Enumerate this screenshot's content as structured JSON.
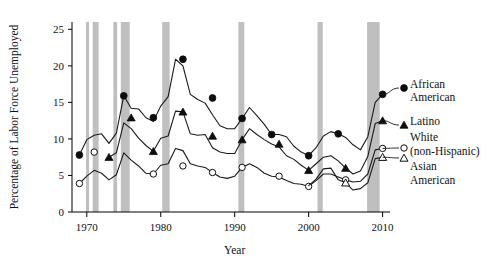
{
  "chart_data": {
    "type": "line",
    "title": "",
    "xlabel": "Year",
    "ylabel": "Percentage of Labor Force Unemployed",
    "xlim": [
      1968,
      2011
    ],
    "ylim": [
      0,
      26
    ],
    "xticks": [
      1970,
      1980,
      1990,
      2000,
      2010
    ],
    "xticklabels": [
      "1970",
      "1980",
      "1990",
      "2000",
      "2010"
    ],
    "yticks": [
      0,
      5,
      10,
      15,
      20,
      25
    ],
    "yticklabels": [
      "0",
      "5",
      "10",
      "15",
      "20",
      "25"
    ],
    "grid": false,
    "legend_position": "right-outside",
    "recession_bands": [
      {
        "start": 1969.9,
        "end": 1970.3
      },
      {
        "start": 1970.8,
        "end": 1971.6
      },
      {
        "start": 1973.6,
        "end": 1974.1
      },
      {
        "start": 1974.6,
        "end": 1975.8
      },
      {
        "start": 1980.2,
        "end": 1981.2
      },
      {
        "start": 1990.5,
        "end": 1991.3
      },
      {
        "start": 2001.2,
        "end": 2001.9
      },
      {
        "start": 2007.9,
        "end": 2009.6
      }
    ],
    "series": [
      {
        "name": "African American",
        "label_lines": [
          "African",
          "American"
        ],
        "marker": "filled-circle",
        "x": [
          1969,
          1970,
          1971,
          1972,
          1973,
          1974,
          1975,
          1976,
          1977,
          1978,
          1979,
          1980,
          1981,
          1982,
          1983,
          1984,
          1985,
          1986,
          1987,
          1988,
          1989,
          1990,
          1991,
          1992,
          1993,
          1994,
          1995,
          1996,
          1997,
          1998,
          1999,
          2000,
          2001,
          2002,
          2003,
          2004,
          2005,
          2006,
          2007,
          2008,
          2009,
          2010
        ],
        "y": [
          7.8,
          9.9,
          10.5,
          10.7,
          9.4,
          10.8,
          15.9,
          14.2,
          14.1,
          12.9,
          12.4,
          14.5,
          15.8,
          20.9,
          20.0,
          16.1,
          15.4,
          14.9,
          13.3,
          11.8,
          11.4,
          11.4,
          12.8,
          14.3,
          13.2,
          12.0,
          10.6,
          10.6,
          10.3,
          9.0,
          8.2,
          7.7,
          8.8,
          10.4,
          11.0,
          10.7,
          10.2,
          9.2,
          8.5,
          10.3,
          15.0,
          16.1
        ],
        "annotated_points": [
          {
            "x": 1969,
            "y": 7.8
          },
          {
            "x": 1975,
            "y": 15.9
          },
          {
            "x": 1979,
            "y": 12.9
          },
          {
            "x": 1983,
            "y": 20.9
          },
          {
            "x": 1987,
            "y": 15.6
          },
          {
            "x": 1991,
            "y": 12.8
          },
          {
            "x": 1995,
            "y": 10.6
          },
          {
            "x": 2000,
            "y": 7.7
          },
          {
            "x": 2004,
            "y": 10.7
          },
          {
            "x": 2010,
            "y": 16.1
          }
        ]
      },
      {
        "name": "Latino",
        "label_lines": [
          "Latino"
        ],
        "marker": "filled-triangle",
        "x": [
          1973,
          1974,
          1975,
          1976,
          1977,
          1978,
          1979,
          1980,
          1981,
          1982,
          1983,
          1984,
          1985,
          1986,
          1987,
          1988,
          1989,
          1990,
          1991,
          1992,
          1993,
          1994,
          1995,
          1996,
          1997,
          1998,
          1999,
          2000,
          2001,
          2002,
          2003,
          2004,
          2005,
          2006,
          2007,
          2008,
          2009,
          2010
        ],
        "y": [
          7.5,
          8.1,
          12.2,
          11.4,
          10.1,
          9.1,
          8.3,
          10.1,
          10.4,
          13.8,
          13.7,
          10.7,
          10.5,
          10.6,
          8.8,
          8.2,
          8.0,
          8.0,
          9.9,
          11.4,
          10.6,
          9.9,
          9.3,
          8.9,
          7.7,
          7.2,
          6.4,
          5.7,
          6.6,
          7.5,
          7.7,
          7.0,
          6.0,
          5.2,
          5.6,
          7.6,
          12.1,
          12.5
        ],
        "annotated_points": [
          {
            "x": 1973,
            "y": 7.5
          },
          {
            "x": 1976,
            "y": 12.9
          },
          {
            "x": 1979,
            "y": 8.3
          },
          {
            "x": 1983,
            "y": 13.7
          },
          {
            "x": 1987,
            "y": 10.4
          },
          {
            "x": 1991,
            "y": 9.9
          },
          {
            "x": 1996,
            "y": 9.3
          },
          {
            "x": 2000,
            "y": 5.7
          },
          {
            "x": 2005,
            "y": 6.0
          },
          {
            "x": 2010,
            "y": 12.5
          }
        ]
      },
      {
        "name": "White (non-Hispanic)",
        "label_lines": [
          "White",
          "(non-Hispanic)"
        ],
        "marker": "open-circle",
        "x": [
          1969,
          1970,
          1971,
          1972,
          1973,
          1974,
          1975,
          1976,
          1977,
          1978,
          1979,
          1980,
          1981,
          1982,
          1983,
          1984,
          1985,
          1986,
          1987,
          1988,
          1989,
          1990,
          1991,
          1992,
          1993,
          1994,
          1995,
          1996,
          1997,
          1998,
          1999,
          2000,
          2001,
          2002,
          2003,
          2004,
          2005,
          2006,
          2007,
          2008,
          2009,
          2010
        ],
        "y": [
          3.9,
          4.9,
          5.7,
          5.3,
          4.4,
          5.1,
          8.1,
          7.1,
          6.3,
          5.3,
          5.2,
          6.4,
          6.6,
          8.7,
          8.4,
          6.6,
          6.3,
          6.1,
          5.4,
          4.8,
          4.6,
          4.9,
          6.1,
          6.6,
          6.1,
          5.3,
          4.9,
          4.8,
          4.3,
          3.9,
          3.8,
          3.5,
          4.3,
          5.2,
          5.2,
          4.8,
          4.4,
          4.1,
          4.2,
          5.2,
          8.5,
          8.7
        ],
        "annotated_points": [
          {
            "x": 1969,
            "y": 3.9
          },
          {
            "x": 1971,
            "y": 8.2
          },
          {
            "x": 1979,
            "y": 5.2
          },
          {
            "x": 1983,
            "y": 6.3
          },
          {
            "x": 1987,
            "y": 5.4
          },
          {
            "x": 1991,
            "y": 6.1
          },
          {
            "x": 1996,
            "y": 4.9
          },
          {
            "x": 2000,
            "y": 3.5
          },
          {
            "x": 2005,
            "y": 4.4
          },
          {
            "x": 2010,
            "y": 8.7
          }
        ]
      },
      {
        "name": "Asian American",
        "label_lines": [
          "Asian",
          "American"
        ],
        "marker": "open-triangle",
        "x": [
          2000,
          2001,
          2002,
          2003,
          2004,
          2005,
          2006,
          2007,
          2008,
          2009,
          2010
        ],
        "y": [
          3.6,
          4.5,
          5.9,
          6.0,
          4.4,
          4.0,
          3.0,
          3.2,
          4.0,
          7.3,
          7.5
        ],
        "annotated_points": [
          {
            "x": 2005,
            "y": 4.0
          },
          {
            "x": 2010,
            "y": 7.5
          }
        ]
      }
    ]
  }
}
